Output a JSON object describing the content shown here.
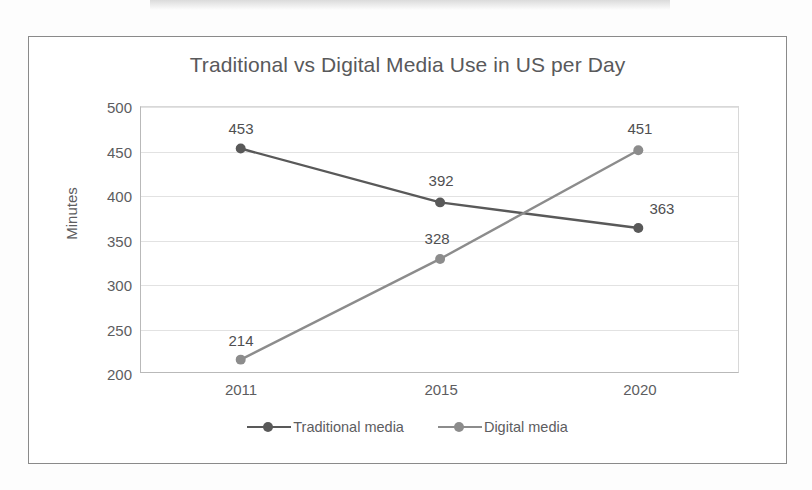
{
  "chart_data": {
    "type": "line",
    "title": "Traditional vs Digital Media Use in US per Day",
    "xlabel": "",
    "ylabel": "Minutes",
    "categories": [
      "2011",
      "2015",
      "2020"
    ],
    "ylim": [
      200,
      500
    ],
    "yticks": [
      "200",
      "250",
      "300",
      "350",
      "400",
      "450",
      "500"
    ],
    "grid": true,
    "legend_position": "bottom",
    "series": [
      {
        "name": "Traditional media",
        "color": "#595959",
        "values": [
          453,
          392,
          363
        ],
        "labels": [
          "453",
          "392",
          "363"
        ]
      },
      {
        "name": "Digital media",
        "color": "#8c8c8c",
        "values": [
          214,
          328,
          451
        ],
        "labels": [
          "214",
          "328",
          "451"
        ]
      }
    ]
  },
  "colors": {
    "traditional": "#595959",
    "digital": "#8c8c8c",
    "frame": "#8a8a8a",
    "gridline": "#e2e2e2",
    "text": "#5d5d5f"
  }
}
